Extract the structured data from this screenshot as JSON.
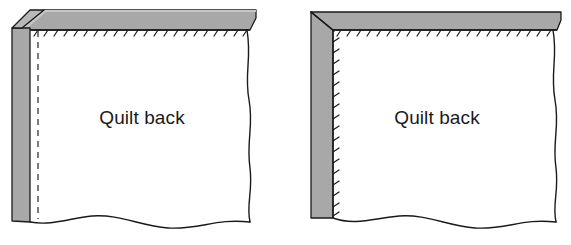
{
  "figure": {
    "panel_count": 2,
    "background_color": "#ffffff"
  },
  "colors": {
    "binding_gray": "#a8a8a8",
    "binding_gray_top": "#adadad",
    "outline": "#1a1a1a",
    "quilt_back_fill": "#ffffff",
    "stitch": "#1a1a1a",
    "basting_dash": "#555555",
    "label_text": "#1a1a1a"
  },
  "panels": [
    {
      "id": "left",
      "name": "panel-left-binding-folded-corner",
      "label": "Quilt back",
      "label_x": 142,
      "label_y": 124,
      "binding": {
        "top_strip_label": "binding-strip-top",
        "left_strip_label": "binding-strip-left",
        "corner_type": "folded",
        "has_mitered_seam": false,
        "fill": "#a8a8a8"
      },
      "basting_line": {
        "name": "basting-dashed-line",
        "style": "dashed",
        "x": 38,
        "y_start": 30,
        "y_end": 218,
        "dash_pattern": "6 5"
      },
      "stitch_edges": [
        "top"
      ],
      "stitch_count_top": 22,
      "raw_edges": [
        "right",
        "bottom"
      ]
    },
    {
      "id": "right",
      "name": "panel-right-binding-mitered-corner",
      "label": "Quilt back",
      "label_x": 152,
      "label_y": 124,
      "binding": {
        "top_strip_label": "binding-strip-top",
        "left_strip_label": "binding-strip-left",
        "corner_type": "mitered",
        "has_mitered_seam": true,
        "fill": "#a8a8a8"
      },
      "basting_line": null,
      "stitch_edges": [
        "top",
        "left"
      ],
      "stitch_count_top": 22,
      "stitch_count_left": 17,
      "raw_edges": [
        "right",
        "bottom"
      ]
    }
  ]
}
